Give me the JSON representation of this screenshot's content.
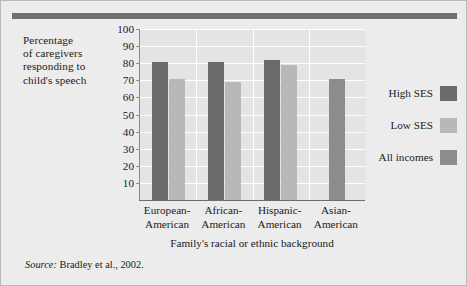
{
  "figure": {
    "y_axis_title": "Percentage of caregivers responding to child's speech",
    "y_axis_title_lines": [
      "Percentage",
      "of caregivers",
      "responding to",
      "child's speech"
    ],
    "x_axis_title": "Family's racial or ethnic background",
    "source_prefix": "Source:",
    "source_text": "Bradley et al., 2002.",
    "accent_color": "#6f6f6f",
    "background_color": "#ececec",
    "plot_background_color": "#e4e4e4",
    "gridline_color": "#ffffff"
  },
  "legend": {
    "position": "right",
    "items": [
      {
        "label": "High SES",
        "color": "#6a6a6a"
      },
      {
        "label": "Low SES",
        "color": "#b8b8b8"
      },
      {
        "label": "All incomes",
        "color": "#8c8c8c"
      }
    ]
  },
  "chart_data": {
    "type": "bar",
    "title": "",
    "xlabel": "Family's racial or ethnic background",
    "ylabel": "Percentage of caregivers responding to child's speech",
    "ylim": [
      0,
      100
    ],
    "yticks": [
      10,
      20,
      30,
      40,
      50,
      60,
      70,
      80,
      90,
      100
    ],
    "grid": true,
    "legend_position": "right",
    "categories": [
      "European-American",
      "African-American",
      "Hispanic-American",
      "Asian-American"
    ],
    "category_lines": [
      [
        "European-",
        "American"
      ],
      [
        "African-",
        "American"
      ],
      [
        "Hispanic-",
        "American"
      ],
      [
        "Asian-",
        "American"
      ]
    ],
    "series": [
      {
        "name": "High SES",
        "color": "#6a6a6a",
        "values": [
          81,
          81,
          82,
          null
        ]
      },
      {
        "name": "Low SES",
        "color": "#b8b8b8",
        "values": [
          71,
          69,
          79,
          null
        ]
      },
      {
        "name": "All incomes",
        "color": "#8c8c8c",
        "values": [
          null,
          null,
          null,
          71
        ]
      }
    ]
  }
}
